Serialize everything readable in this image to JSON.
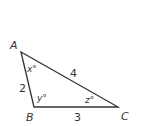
{
  "diagram": {
    "type": "triangle",
    "vertices": [
      {
        "label": "A",
        "x": 21,
        "y": 52,
        "lx": 10,
        "ly": 49
      },
      {
        "label": "B",
        "x": 34,
        "y": 107,
        "lx": 26,
        "ly": 121
      },
      {
        "label": "C",
        "x": 118,
        "y": 107,
        "lx": 121,
        "ly": 120
      }
    ],
    "sides": [
      {
        "label": "2",
        "between": "AB",
        "x": 19,
        "y": 92
      },
      {
        "label": "4",
        "between": "AC",
        "x": 70,
        "y": 77
      },
      {
        "label": "3",
        "between": "BC",
        "x": 74,
        "y": 121
      }
    ],
    "angles": [
      {
        "label": "x°",
        "at": "A",
        "x": 27,
        "y": 72
      },
      {
        "label": "y°",
        "at": "B",
        "x": 37,
        "y": 101
      },
      {
        "label": "z°",
        "at": "C",
        "x": 85,
        "y": 103
      }
    ],
    "stroke_color": "#333333"
  }
}
